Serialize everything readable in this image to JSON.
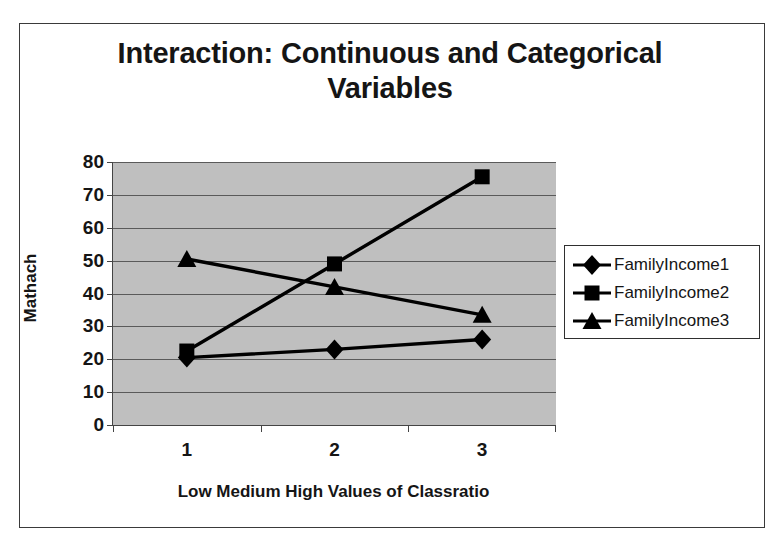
{
  "figure": {
    "title": "Interaction: Continuous and Categorical Variables"
  },
  "chart_data": {
    "type": "line",
    "title": "Interaction: Continuous and Categorical Variables",
    "xlabel": "Low Medium High Values of Classratio",
    "ylabel": "Mathach",
    "categories": [
      "1",
      "2",
      "3"
    ],
    "x_tick_labels": [
      "1",
      "2",
      "3"
    ],
    "y_tick_labels": [
      "0",
      "10",
      "20",
      "30",
      "40",
      "50",
      "60",
      "70",
      "80"
    ],
    "ylim": [
      0,
      80
    ],
    "y_major_step": 10,
    "grid": "horizontal",
    "legend_position": "right",
    "plot_background": "#bfbfbf",
    "series_color": "#000000",
    "series": [
      {
        "name": "FamilyIncome1",
        "marker": "diamond",
        "values": [
          20.5,
          23.0,
          26.0
        ]
      },
      {
        "name": "FamilyIncome2",
        "marker": "square",
        "values": [
          22.5,
          49.0,
          75.5
        ]
      },
      {
        "name": "FamilyIncome3",
        "marker": "triangle",
        "values": [
          50.5,
          42.0,
          33.5
        ]
      }
    ]
  }
}
